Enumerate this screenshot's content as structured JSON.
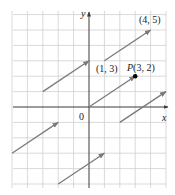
{
  "diagram": {
    "type": "coordinate-plane-vectors",
    "x_range": [
      -5,
      5
    ],
    "y_range": [
      -5,
      6
    ],
    "axis_labels": {
      "x": "x",
      "y": "y"
    },
    "origin_label": "0",
    "colors": {
      "grid": "#cfcfcf",
      "axis": "#3a3a3a",
      "vector": "#7a7a7a",
      "point": "#000000"
    },
    "vectors": [
      {
        "from": [
          0,
          0
        ],
        "to": [
          3,
          2
        ]
      },
      {
        "from": [
          1,
          3
        ],
        "to": [
          4,
          5
        ]
      },
      {
        "from": [
          -3,
          1
        ],
        "to": [
          0,
          3
        ]
      },
      {
        "from": [
          -5,
          -3
        ],
        "to": [
          -2,
          -1
        ]
      },
      {
        "from": [
          -2,
          -5
        ],
        "to": [
          1,
          -3
        ]
      },
      {
        "from": [
          2,
          -1
        ],
        "to": [
          5,
          1
        ]
      }
    ],
    "point": {
      "at": [
        3,
        2
      ],
      "name": "P",
      "coords_text": "(3, 2)"
    },
    "annotations": [
      {
        "text": "(4, 5)",
        "at": [
          4,
          5
        ]
      },
      {
        "text": "(1, 3)",
        "at": [
          1,
          3
        ]
      }
    ]
  }
}
